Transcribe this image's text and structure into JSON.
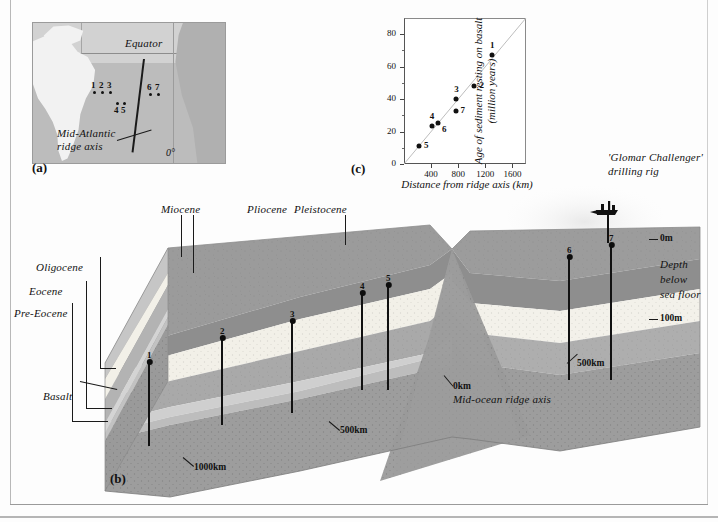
{
  "figure": {
    "panels": [
      {
        "tag": "(a)",
        "kind": "locality-map"
      },
      {
        "tag": "(b)",
        "kind": "block-diagram"
      },
      {
        "tag": "(c)",
        "kind": "scatter-plot"
      }
    ]
  },
  "map": {
    "tag": "(a)",
    "equator_label": "Equator",
    "ridge_label_line1": "Mid-Atlantic",
    "ridge_label_line2": "ridge axis",
    "meridian_label": "0°",
    "sites": [
      {
        "id": "1",
        "x": 60,
        "y": 68,
        "label_dx": -2,
        "label_dy": -11
      },
      {
        "id": "2",
        "x": 68,
        "y": 68,
        "label_dx": -2,
        "label_dy": -11
      },
      {
        "id": "3",
        "x": 76,
        "y": 68,
        "label_dx": -2,
        "label_dy": -11
      },
      {
        "id": "4",
        "x": 83,
        "y": 79,
        "label_dx": -2,
        "label_dy": 3
      },
      {
        "id": "5",
        "x": 90,
        "y": 79,
        "label_dx": -2,
        "label_dy": 3
      },
      {
        "id": "6",
        "x": 116,
        "y": 70,
        "label_dx": -2,
        "label_dy": -11
      },
      {
        "id": "7",
        "x": 124,
        "y": 70,
        "label_dx": -2,
        "label_dy": -11
      }
    ]
  },
  "chart_data": {
    "type": "scatter",
    "tag": "(c)",
    "title": "",
    "xlabel": "Distance from ridge axis (km)",
    "ylabel": "Age of sediment resting on basalt (million years)",
    "ylabel_line1": "Age of sediment resting on basalt",
    "ylabel_line2": "(million years)",
    "xlim": [
      0,
      1800
    ],
    "ylim": [
      0,
      90
    ],
    "xticks": [
      0,
      400,
      800,
      1200,
      1600
    ],
    "xtick_labels": [
      "",
      "400",
      "800",
      "1200",
      "1600"
    ],
    "yticks": [
      0,
      20,
      40,
      60,
      80
    ],
    "ytick_labels": [
      "0",
      "20",
      "40",
      "60",
      "80"
    ],
    "grid": false,
    "legend": "none",
    "trendline": {
      "x0": 0,
      "y0": 0,
      "x1": 1800,
      "y1": 90
    },
    "points": [
      {
        "label": "1",
        "x": 1300,
        "y": 67,
        "label_pos": "above"
      },
      {
        "label": "2",
        "x": 1040,
        "y": 48,
        "label_pos": "right"
      },
      {
        "label": "3",
        "x": 770,
        "y": 40,
        "label_pos": "above"
      },
      {
        "label": "4",
        "x": 410,
        "y": 23.5,
        "label_pos": "above"
      },
      {
        "label": "5",
        "x": 220,
        "y": 11,
        "label_pos": "right"
      },
      {
        "label": "6",
        "x": 500,
        "y": 25,
        "label_pos": "below-right"
      },
      {
        "label": "7",
        "x": 760,
        "y": 32.5,
        "label_pos": "right"
      }
    ]
  },
  "block": {
    "tag": "(b)",
    "strata_labels": [
      "Miocene",
      "Pliocene",
      "Pleistocene",
      "Oligocene",
      "Eocene",
      "Pre-Eocene",
      "Basalt"
    ],
    "rig_label_line1": "'Glomar Challenger'",
    "rig_label_line2": "drilling rig",
    "depth_axis": {
      "title_line1": "Depth",
      "title_line2": "below",
      "title_line3": "sea floor",
      "ticks": [
        "0m",
        "100m"
      ]
    },
    "ridge_axis_label": "Mid-ocean ridge axis",
    "distance_markers": [
      "0km",
      "500km",
      "1000km",
      "500km"
    ],
    "drill_holes": [
      {
        "id": "1"
      },
      {
        "id": "2"
      },
      {
        "id": "3"
      },
      {
        "id": "4"
      },
      {
        "id": "5"
      },
      {
        "id": "6"
      },
      {
        "id": "7"
      }
    ]
  },
  "colors": {
    "pleistocene": "#8e8e8e",
    "pliocene": "#f3f1ea",
    "miocene": "#a9a9a9",
    "oligocene": "#c6c6c6",
    "eocene": "#d6d6d6",
    "pre_eocene": "#bdbdbd",
    "basalt": "#9d9d9d",
    "ink": "#111111",
    "map_sea": "#bcbcbc",
    "map_land": "#f2f2f2"
  }
}
